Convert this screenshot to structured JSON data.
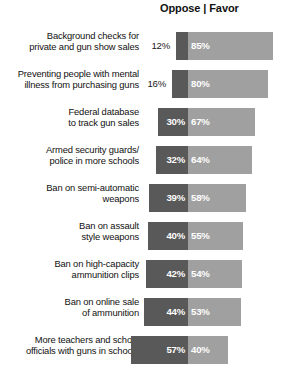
{
  "header": {
    "text": "Oppose | Favor"
  },
  "colors": {
    "oppose": "#595959",
    "favor": "#a0a0a0",
    "inside_label": "#ffffff",
    "outside_label": "#1a1a1a",
    "background": "#ffffff"
  },
  "chart_data": {
    "type": "bar",
    "title": "",
    "subtitle": "",
    "xlabel": "",
    "ylabel": "",
    "grid": false,
    "legend_position": "top",
    "orientation": "horizontal",
    "layout": "diverging",
    "axis_note": "Bars diverge from a fixed center divider: Oppose extends left, Favor extends right. Scale approx 1.0 px per percentage point.",
    "categories": [
      "Background checks for private and gun show sales",
      "Preventing people with mental illness from purchasing guns",
      "Federal database to track gun sales",
      "Armed security guards/ police in more schools",
      "Ban on semi-automatic weapons",
      "Ban on assault style weapons",
      "Ban on high-capacity ammunition clips",
      "Ban on online sale of ammunition",
      "More teachers and school officials with guns in schools"
    ],
    "series": [
      {
        "name": "Oppose",
        "values": [
          12,
          16,
          30,
          32,
          39,
          40,
          42,
          44,
          57
        ]
      },
      {
        "name": "Favor",
        "values": [
          85,
          80,
          67,
          64,
          58,
          55,
          54,
          53,
          40
        ]
      }
    ]
  },
  "rows": [
    {
      "label_lines": [
        "Background checks for",
        "private and gun show sales"
      ],
      "oppose": 12,
      "favor": 85,
      "oppose_text": "12%",
      "favor_text": "85%",
      "oppose_label_inside": false
    },
    {
      "label_lines": [
        "Preventing people with mental",
        "illness from purchasing guns"
      ],
      "oppose": 16,
      "favor": 80,
      "oppose_text": "16%",
      "favor_text": "80%",
      "oppose_label_inside": false
    },
    {
      "label_lines": [
        "Federal database",
        "to track gun sales"
      ],
      "oppose": 30,
      "favor": 67,
      "oppose_text": "30%",
      "favor_text": "67%",
      "oppose_label_inside": true
    },
    {
      "label_lines": [
        "Armed security guards/",
        "police in more schools"
      ],
      "oppose": 32,
      "favor": 64,
      "oppose_text": "32%",
      "favor_text": "64%",
      "oppose_label_inside": true
    },
    {
      "label_lines": [
        "Ban on semi-automatic",
        "weapons"
      ],
      "oppose": 39,
      "favor": 58,
      "oppose_text": "39%",
      "favor_text": "58%",
      "oppose_label_inside": true
    },
    {
      "label_lines": [
        "Ban on assault",
        "style weapons"
      ],
      "oppose": 40,
      "favor": 55,
      "oppose_text": "40%",
      "favor_text": "55%",
      "oppose_label_inside": true
    },
    {
      "label_lines": [
        "Ban on high-capacity",
        "ammunition clips"
      ],
      "oppose": 42,
      "favor": 54,
      "oppose_text": "42%",
      "favor_text": "54%",
      "oppose_label_inside": true
    },
    {
      "label_lines": [
        "Ban on online sale",
        "of ammunition"
      ],
      "oppose": 44,
      "favor": 53,
      "oppose_text": "44%",
      "favor_text": "53%",
      "oppose_label_inside": true
    },
    {
      "label_lines": [
        "More teachers and school",
        "officials with guns in schools"
      ],
      "oppose": 57,
      "favor": 40,
      "oppose_text": "57%",
      "favor_text": "40%",
      "oppose_label_inside": true
    }
  ]
}
